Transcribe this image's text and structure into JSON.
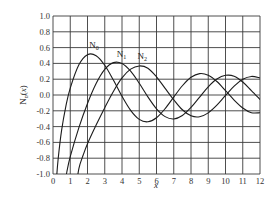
{
  "chart_data": {
    "type": "line",
    "title": "",
    "xlabel": "x",
    "ylabel": "N_n(x)",
    "xlim": [
      0,
      12
    ],
    "ylim": [
      -1.0,
      1.0
    ],
    "grid": true,
    "legend": "inline curve labels",
    "x_ticks": [
      "0",
      "1",
      "2",
      "3",
      "4",
      "5",
      "6",
      "7",
      "8",
      "9",
      "10",
      "11",
      "12"
    ],
    "y_ticks": [
      "1.0",
      "0.8",
      "0.6",
      "0.4",
      "0.2",
      "0.0",
      "-0.2",
      "-0.4",
      "-0.6",
      "-0.8",
      "-1.0"
    ],
    "series": [
      {
        "name": "N0",
        "label": "N",
        "sub": "0",
        "label_pos": [
          2.1,
          0.6
        ],
        "x": [
          0.1,
          0.2,
          0.3,
          0.5,
          0.75,
          1,
          1.5,
          2,
          2.5,
          3,
          3.5,
          4,
          4.5,
          5,
          5.5,
          6,
          6.5,
          7,
          7.5,
          8,
          8.5,
          9,
          9.5,
          10,
          10.5,
          11,
          11.5,
          12
        ],
        "y": [
          -1.534,
          -1.081,
          -0.807,
          -0.444,
          -0.137,
          0.088,
          0.382,
          0.51,
          0.498,
          0.377,
          0.189,
          -0.017,
          -0.195,
          -0.309,
          -0.339,
          -0.288,
          -0.173,
          -0.026,
          0.117,
          0.224,
          0.271,
          0.25,
          0.171,
          0.056,
          -0.064,
          -0.164,
          -0.224,
          -0.225
        ]
      },
      {
        "name": "N1",
        "label": "N",
        "sub": "1",
        "label_pos": [
          3.7,
          0.48
        ],
        "x": [
          0.5,
          0.7,
          0.8,
          1,
          1.5,
          2,
          2.5,
          3,
          3.5,
          4,
          4.5,
          5,
          5.5,
          6,
          6.5,
          7,
          7.5,
          8,
          8.5,
          9,
          9.5,
          10,
          10.5,
          11,
          11.5,
          12
        ],
        "y": [
          -1.471,
          -1.103,
          -0.978,
          -0.781,
          -0.412,
          -0.107,
          0.146,
          0.325,
          0.41,
          0.398,
          0.301,
          0.148,
          -0.024,
          -0.175,
          -0.274,
          -0.303,
          -0.259,
          -0.158,
          -0.026,
          0.104,
          0.202,
          0.249,
          0.238,
          0.164,
          0.055,
          -0.057
        ]
      },
      {
        "name": "N2",
        "label": "N",
        "sub": "2",
        "label_pos": [
          4.9,
          0.45
        ],
        "x": [
          1.3,
          1.5,
          1.75,
          2,
          2.5,
          3,
          3.5,
          4,
          4.5,
          5,
          5.5,
          6,
          6.5,
          7,
          7.5,
          8,
          8.5,
          9,
          9.5,
          10,
          10.5,
          11,
          11.5,
          12
        ],
        "y": [
          -1.23,
          -0.932,
          -0.76,
          -0.617,
          -0.381,
          -0.16,
          0.045,
          0.216,
          0.327,
          0.368,
          0.339,
          0.23,
          0.084,
          -0.06,
          -0.187,
          -0.263,
          -0.275,
          -0.226,
          -0.129,
          -0.006,
          0.113,
          0.199,
          0.235,
          0.216
        ]
      }
    ]
  }
}
